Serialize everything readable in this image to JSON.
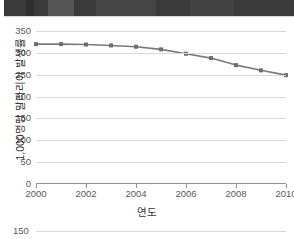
{
  "page": {
    "background_color": "#ffffff",
    "top_band_color": "#3a3a3a"
  },
  "chart_data": {
    "type": "line",
    "title": "",
    "xlabel": "연도",
    "ylabel": "1,000명당 말라리아 발생률",
    "x": [
      2000,
      2001,
      2002,
      2003,
      2004,
      2005,
      2006,
      2007,
      2008,
      2009,
      2010
    ],
    "values": [
      320,
      320,
      319,
      317,
      314,
      308,
      298,
      288,
      272,
      260,
      249
    ],
    "series": [
      {
        "name": "1,000명당 말라리아 발생률",
        "values": [
          320,
          320,
          319,
          317,
          314,
          308,
          298,
          288,
          272,
          260,
          249
        ]
      }
    ],
    "xlim": [
      2000,
      2010
    ],
    "ylim": [
      0,
      350
    ],
    "xticks": [
      "2000",
      "2002",
      "2004",
      "2006",
      "2008",
      "2010"
    ],
    "xtick_values": [
      2000,
      2002,
      2004,
      2006,
      2008,
      2010
    ],
    "yticks": [
      "0",
      "50",
      "100",
      "150",
      "200",
      "250",
      "300",
      "350"
    ],
    "ytick_values": [
      0,
      50,
      100,
      150,
      200,
      250,
      300,
      350
    ],
    "grid": true,
    "grid_axis": "y",
    "legend": false,
    "legend_position": "none",
    "line_color": "#7a7a7a",
    "marker_color": "#6e6e6e",
    "marker": "square",
    "gridline_color": "#d9d9d9",
    "axis_color": "#909090"
  },
  "chart2_partial": {
    "type": "line",
    "ytick_visible": "150",
    "note": ""
  }
}
